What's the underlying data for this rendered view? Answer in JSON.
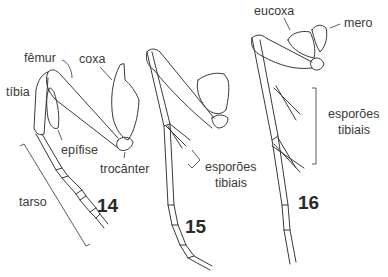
{
  "figure": {
    "panels": [
      {
        "number": "14",
        "labels": {
          "femur": "fêmur",
          "coxa": "coxa",
          "tibia": "tíbia",
          "epifise": "epífise",
          "trocanter": "trocânter",
          "tarso": "tarso"
        }
      },
      {
        "number": "15",
        "labels": {
          "esporoes_tibiais_line1": "esporões",
          "esporoes_tibiais_line2": "tibiais"
        }
      },
      {
        "number": "16",
        "labels": {
          "eucoxa": "eucoxa",
          "mero": "mero",
          "esporoes_tibiais_line1": "esporões",
          "esporoes_tibiais_line2": "tibiais"
        }
      }
    ],
    "colors": {
      "background": "#ffffff",
      "line": "#3a3a3a",
      "text": "#3a3a3a"
    }
  }
}
